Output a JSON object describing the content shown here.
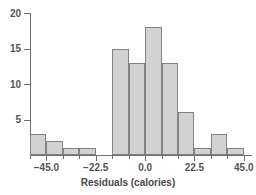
{
  "chart_data": {
    "type": "bar",
    "title": "",
    "subtitle": "",
    "xlabel": "Residuals (calories)",
    "ylabel": "",
    "grid": false,
    "legend": false,
    "legend_position": "none",
    "xlim": [
      -52.5,
      48.75
    ],
    "ylim": [
      0,
      20
    ],
    "bin_width": 7.5,
    "x_tick_labels": [
      "-45.0",
      "-22.5",
      "0.0",
      "22.5",
      "45.0"
    ],
    "x_tick_values": [
      -45.0,
      -22.5,
      0.0,
      22.5,
      45.0
    ],
    "y_tick_labels": [
      "5",
      "10",
      "15",
      "20"
    ],
    "y_tick_values": [
      5,
      10,
      15,
      20
    ],
    "categories": [
      "-48.75",
      "-41.25",
      "-33.75",
      "-26.25",
      "-18.75",
      "-11.25",
      "-3.75",
      "3.75",
      "11.25",
      "18.75",
      "26.25",
      "33.75",
      "41.25"
    ],
    "bin_edges": [
      -52.5,
      -45.0,
      -37.5,
      -30.0,
      -22.5,
      -15.0,
      -7.5,
      0.0,
      7.5,
      15.0,
      22.5,
      30.0,
      37.5,
      45.0
    ],
    "values": [
      3,
      2,
      1,
      1,
      0,
      15,
      13,
      18,
      13,
      6,
      1,
      3,
      1
    ],
    "colors": {
      "bar_fill": "#d2d2d2",
      "bar_border": "#828282",
      "axis": "#6e6e6e",
      "text": "#4a4a4a",
      "background": "#ffffff"
    }
  }
}
